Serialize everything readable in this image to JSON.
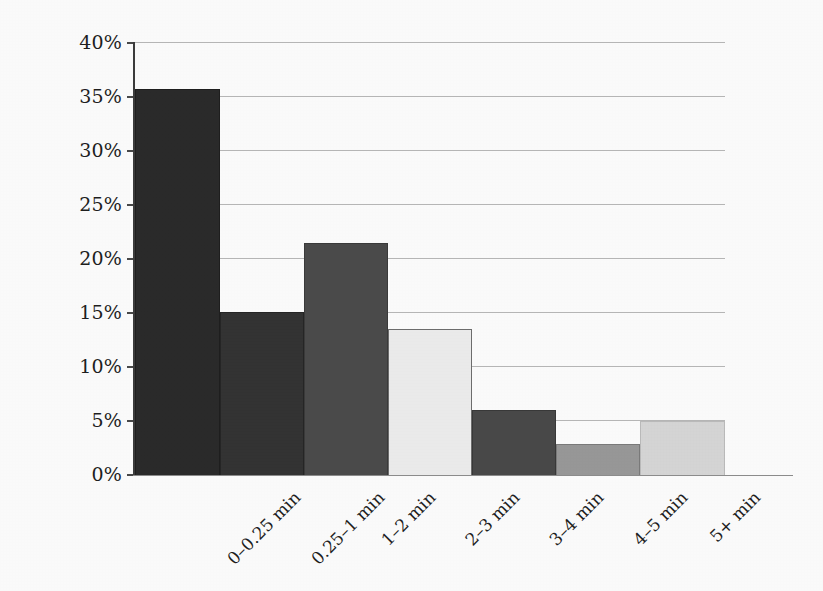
{
  "chart_data": {
    "type": "bar",
    "title": "",
    "subtitle": "",
    "xlabel": "",
    "ylabel": "",
    "categories": [
      "0–0.25 min",
      "0.25–1 min",
      "1–2 min",
      "2–3 min",
      "3–4 min",
      "4–5 min",
      "5+ min"
    ],
    "values": [
      35.7,
      15.1,
      21.4,
      13.5,
      6.0,
      2.9,
      5.0
    ],
    "value_suffix": "%",
    "ylim": [
      0,
      40
    ],
    "ytick_step": 5,
    "ytick_labels": [
      "40%",
      "35%",
      "30%",
      "25%",
      "20%",
      "15%",
      "10%",
      "5%",
      "0%"
    ],
    "ytick_values": [
      40,
      35,
      30,
      25,
      20,
      15,
      10,
      5,
      0
    ],
    "grid": true,
    "grid_axis": "y",
    "legend": false,
    "legend_position": "none",
    "bar_gap": 0,
    "bar_colors": [
      "#2b2b2b",
      "#343434",
      "#4c4c4c",
      "#efefef",
      "#4a4a4a",
      "#9a9a9a",
      "#d8d8d8"
    ],
    "bar_border_colors": [
      "#1f1f1f",
      "#262626",
      "#3c3c3c",
      "#6f6f6f",
      "#3a3a3a",
      "#7c7c7c",
      "#bdbdbd"
    ],
    "axis_color": "#3d3d3d",
    "gridline_color": "#b9b9b9",
    "background_color": "#ffffff",
    "text_color": "#1f1f1f",
    "x_label_rotation": -45
  }
}
